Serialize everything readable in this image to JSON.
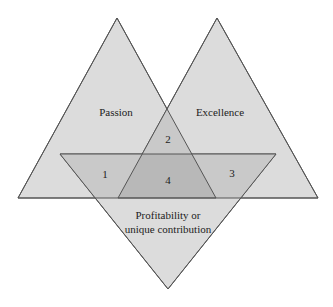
{
  "diagram": {
    "type": "three-triangle venn",
    "circles": [
      {
        "label": "Passion"
      },
      {
        "label": "Excellence"
      },
      {
        "label_line1": "Profitability or",
        "label_line2": "unique contribution"
      }
    ],
    "regions": {
      "r1": "1",
      "r2": "2",
      "r3": "3",
      "r4": "4"
    },
    "colors": {
      "fill": "#d9d9d9",
      "stroke": "#555555",
      "text": "#222222"
    }
  }
}
